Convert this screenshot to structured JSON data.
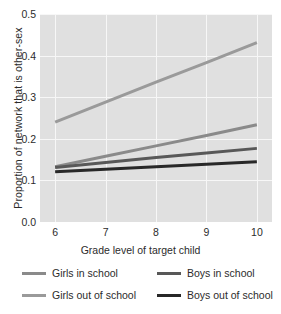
{
  "chart_data": {
    "type": "line",
    "title": "",
    "xlabel": "Grade level of target child",
    "ylabel": "Proportion of network that is other-sex",
    "x": [
      6,
      7,
      8,
      9,
      10
    ],
    "xticklabels": [
      "6",
      "7",
      "8",
      "9",
      "10"
    ],
    "yticklabels": [
      "0.0",
      "0.1",
      "0.2",
      "0.3",
      "0.4",
      "0.5"
    ],
    "yticks": [
      0.0,
      0.1,
      0.2,
      0.3,
      0.4,
      0.5
    ],
    "xlim": [
      5.7,
      10.3
    ],
    "ylim": [
      0.0,
      0.5
    ],
    "grid": true,
    "legend_position": "below",
    "plot_background": "#e0e0e0",
    "grid_color": "#f7f7f7",
    "series": [
      {
        "name": "Girls out of school",
        "color": "#9a9a9a",
        "width": 3.0,
        "values": [
          0.24,
          0.288,
          0.336,
          0.383,
          0.431
        ]
      },
      {
        "name": "Girls in school",
        "color": "#8a8a8a",
        "width": 3.0,
        "values": [
          0.133,
          0.158,
          0.183,
          0.208,
          0.234
        ]
      },
      {
        "name": "Boys in school",
        "color": "#585858",
        "width": 3.0,
        "values": [
          0.131,
          0.143,
          0.155,
          0.166,
          0.177
        ]
      },
      {
        "name": "Boys out of school",
        "color": "#282828",
        "width": 3.0,
        "values": [
          0.121,
          0.127,
          0.133,
          0.139,
          0.145
        ]
      }
    ]
  },
  "legend": {
    "items": [
      {
        "label": "Girls in school",
        "color": "#8a8a8a"
      },
      {
        "label": "Boys in school",
        "color": "#585858"
      },
      {
        "label": "Girls out of school",
        "color": "#9a9a9a"
      },
      {
        "label": "Boys out of school",
        "color": "#282828"
      }
    ]
  }
}
